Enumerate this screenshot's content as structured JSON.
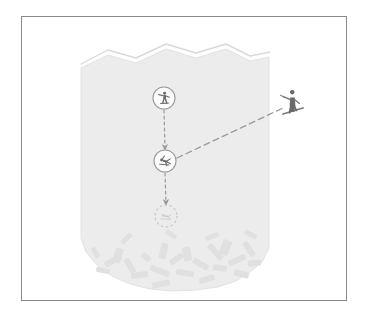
{
  "figure": {
    "frame": {
      "x": 21,
      "y": 16,
      "width": 326,
      "height": 285,
      "stroke": "#8a8a8a",
      "fill": "#ffffff"
    },
    "colors": {
      "slab_fill": "#ececec",
      "slab_stroke": "#e2e2e2",
      "crown_outline": "#d9d9d9",
      "crown_gap": "#ffffff",
      "debris_fill": "#e0e0e0",
      "marker_stroke": "#9a9a9a",
      "marker_fill": "#fbfbfb",
      "icon_fill": "#6e6e6e",
      "arrow_stroke": "#9a9a9a",
      "trigger_line_stroke": "#9a9a9a",
      "skier_fill": "#6a6a6a",
      "background": "#ffffff"
    }
  },
  "slab": {
    "name": "snow-slab",
    "description": "Shaded slab polygon with jagged crown line at top and irregular toe at bottom",
    "crown_outline_path": "M 81 64 L 108 50 L 136 58 L 166 44 L 196 53 L 226 44 L 250 56 L 270 52",
    "slab_path": "M 81 68 L 108 55 L 136 63 L 166 49 L 196 58 L 226 49 L 250 61 L 269 57 L 269 248 L 262 262 L 250 272 L 236 281 L 218 287 L 196 290 L 172 291 L 150 289 L 130 284 L 112 276 L 97 265 L 86 252 L 81 238 Z"
  },
  "crown": {
    "name": "crown-line",
    "label": ""
  },
  "debris": {
    "name": "debris-field",
    "count": 26,
    "blocks": [
      {
        "x": 104,
        "y": 258,
        "w": 18,
        "h": 6,
        "rot": -28
      },
      {
        "x": 96,
        "y": 268,
        "w": 14,
        "h": 5,
        "rot": 12
      },
      {
        "x": 114,
        "y": 248,
        "w": 8,
        "h": 15,
        "rot": 18
      },
      {
        "x": 122,
        "y": 263,
        "w": 16,
        "h": 6,
        "rot": 62
      },
      {
        "x": 131,
        "y": 272,
        "w": 17,
        "h": 6,
        "rot": -8
      },
      {
        "x": 141,
        "y": 254,
        "w": 10,
        "h": 6,
        "rot": 40
      },
      {
        "x": 150,
        "y": 268,
        "w": 20,
        "h": 6,
        "rot": 22
      },
      {
        "x": 152,
        "y": 281,
        "w": 18,
        "h": 6,
        "rot": -12
      },
      {
        "x": 160,
        "y": 243,
        "w": 7,
        "h": 16,
        "rot": 14
      },
      {
        "x": 169,
        "y": 256,
        "w": 15,
        "h": 6,
        "rot": -34
      },
      {
        "x": 176,
        "y": 270,
        "w": 18,
        "h": 6,
        "rot": 10
      },
      {
        "x": 183,
        "y": 247,
        "w": 8,
        "h": 14,
        "rot": -10
      },
      {
        "x": 192,
        "y": 261,
        "w": 17,
        "h": 6,
        "rot": 30
      },
      {
        "x": 199,
        "y": 276,
        "w": 16,
        "h": 6,
        "rot": -16
      },
      {
        "x": 206,
        "y": 249,
        "w": 19,
        "h": 6,
        "rot": 48
      },
      {
        "x": 213,
        "y": 265,
        "w": 14,
        "h": 6,
        "rot": 8
      },
      {
        "x": 221,
        "y": 240,
        "w": 9,
        "h": 15,
        "rot": 22
      },
      {
        "x": 228,
        "y": 257,
        "w": 18,
        "h": 6,
        "rot": -24
      },
      {
        "x": 234,
        "y": 271,
        "w": 15,
        "h": 6,
        "rot": 14
      },
      {
        "x": 241,
        "y": 246,
        "w": 16,
        "h": 6,
        "rot": 56
      },
      {
        "x": 248,
        "y": 260,
        "w": 13,
        "h": 6,
        "rot": -6
      },
      {
        "x": 120,
        "y": 236,
        "w": 13,
        "h": 5,
        "rot": -44
      },
      {
        "x": 165,
        "y": 232,
        "w": 12,
        "h": 5,
        "rot": 36
      },
      {
        "x": 205,
        "y": 234,
        "w": 14,
        "h": 5,
        "rot": -20
      },
      {
        "x": 244,
        "y": 232,
        "w": 13,
        "h": 5,
        "rot": 28
      },
      {
        "x": 90,
        "y": 250,
        "w": 11,
        "h": 5,
        "rot": 60
      }
    ]
  },
  "markers": [
    {
      "id": "marker-1",
      "name": "rider-marker-top",
      "icon": "skier-icon",
      "cx": 164,
      "cy": 98,
      "r": 11,
      "style": "solid"
    },
    {
      "id": "marker-2",
      "name": "rider-marker-middle",
      "icon": "skier-icon",
      "cx": 165,
      "cy": 161,
      "r": 11,
      "style": "solid"
    },
    {
      "id": "marker-3",
      "name": "burial-marker-bottom",
      "icon": "buried-icon",
      "cx": 166,
      "cy": 216,
      "r": 11,
      "style": "dashed"
    }
  ],
  "arrows": [
    {
      "id": "arrow-1",
      "name": "motion-arrow-top",
      "x1": 164,
      "y1": 110,
      "x2": 165,
      "y2": 148,
      "dash": "3 3",
      "head": true
    },
    {
      "id": "arrow-2",
      "name": "motion-arrow-bottom",
      "x1": 165,
      "y1": 173,
      "x2": 166,
      "y2": 203,
      "dash": "3 3",
      "head": true
    }
  ],
  "trigger_line": {
    "id": "trigger-line",
    "name": "trigger-path",
    "x1": 177,
    "y1": 158,
    "x2": 283,
    "y2": 108,
    "dash": "6 4"
  },
  "skier": {
    "id": "skier-figure",
    "name": "skier-silhouette",
    "x": 283,
    "y": 92,
    "width": 22,
    "height": 26
  }
}
